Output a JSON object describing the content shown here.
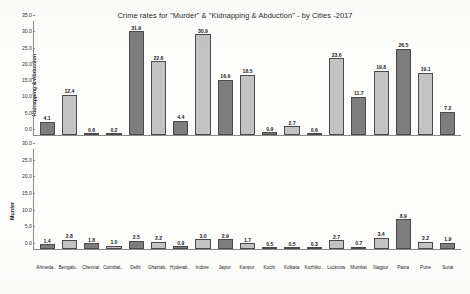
{
  "chart_data": {
    "type": "bar",
    "title": "Crime rates for \"Murder\" & \"Kidnapping & Abduction\" - by Cities -2017",
    "xlabel": "",
    "grid": false,
    "legend": "none",
    "categories": [
      "Ahmeda..",
      "Bengalu..",
      "Chennai",
      "Coimbat..",
      "Delhi",
      "Ghaziab..",
      "Hyderab..",
      "Indore",
      "Jaipur",
      "Kanpur",
      "Kochi",
      "Kolkata",
      "Kozhiko..",
      "Lucknow",
      "Mumbai",
      "Nagpur",
      "Patna",
      "Pune",
      "Surat",
      "Surat"
    ],
    "panels": [
      {
        "ylabel": "Kidnapping & Abduction",
        "ylim": [
          0,
          35
        ],
        "yticks": [
          "0.0",
          "5.0",
          "10.0",
          "15.0",
          "20.0",
          "25.0",
          "30.0",
          "35.0"
        ],
        "values": [
          4.1,
          12.4,
          0.6,
          0.2,
          31.9,
          22.6,
          4.4,
          30.9,
          16.9,
          18.5,
          0.9,
          2.7,
          0.6,
          23.6,
          11.7,
          19.8,
          26.5,
          19.1,
          7.2
        ]
      },
      {
        "ylabel": "Murder",
        "ylim": [
          0,
          30
        ],
        "yticks": [
          "0.0",
          "5.0",
          "10.0",
          "15.0",
          "20.0",
          "25.0",
          "30.0"
        ],
        "values": [
          1.4,
          2.8,
          1.8,
          1.0,
          2.5,
          2.2,
          0.9,
          3.0,
          2.9,
          1.7,
          0.5,
          0.5,
          0.3,
          2.7,
          0.7,
          3.4,
          8.9,
          2.2,
          1.9
        ]
      }
    ],
    "city_labels": [
      "Ahmeda..",
      "Bengalu..",
      "Chennai",
      "Coimbat..",
      "Delhi",
      "Ghaziab..",
      "Hyderab..",
      "Indore",
      "Jaipur",
      "Kanpur",
      "Kochi",
      "Kolkata",
      "Kozhiko..",
      "Lucknow",
      "Mumbai",
      "Nagpur",
      "Patna",
      "Pune",
      "Surat"
    ],
    "colors": {
      "bar_dark": "#7d7d7d",
      "bar_light": "#c2c2c2",
      "bar_border": "#4a4a4a",
      "axis": "#8a8a8a",
      "text": "#1a1a1a",
      "background": "#fdfdfc"
    }
  }
}
